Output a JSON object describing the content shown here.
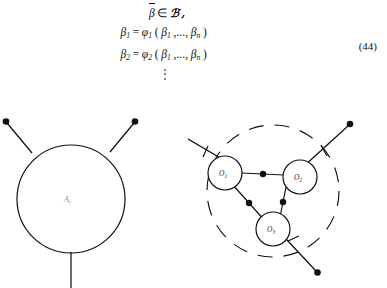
{
  "equation": {
    "number": "(44)",
    "lines": [
      {
        "id": "line-membership",
        "lhs": "β",
        "lhs_bar": true,
        "rel": "∈",
        "rhs": "ℬ′,",
        "text": "β̄ ∈ ℬ′,"
      },
      {
        "id": "line-beta-1",
        "lhs": "β",
        "lhs_sub": "1",
        "rel": "=",
        "fn": "φ",
        "fn_sub": "1",
        "args": "(β1 ,..., βn)",
        "text": "β1 = φ1(β1 ,..., βn)"
      },
      {
        "id": "line-beta-2",
        "lhs": "β",
        "lhs_sub": "2",
        "rel": "=",
        "fn": "φ",
        "fn_sub": "2",
        "args": "(β1 ,..., βn)",
        "text": "β2 = φ2(β1 ,..., βn)"
      },
      {
        "id": "line-vdots",
        "text": "⋮"
      }
    ],
    "arg_first": "β",
    "arg_first_sub": "1",
    "arg_ellipsis": ",...,",
    "arg_last": "β",
    "arg_last_sub": "n",
    "paren_open": "(",
    "paren_close": ")"
  },
  "figures": {
    "left": {
      "name": "blob-vertex-diagram",
      "vertex_label": "A",
      "vertex_label_sub": "i",
      "legs": [
        {
          "id": "leg-upper-left",
          "terminal": "filled-dot"
        },
        {
          "id": "leg-upper-right",
          "terminal": "filled-dot"
        },
        {
          "id": "leg-bottom",
          "terminal": "open"
        }
      ]
    },
    "right": {
      "name": "expanded-triangle-diagram",
      "nodes": [
        {
          "id": "node-o1",
          "label": "O",
          "label_sub": "1"
        },
        {
          "id": "node-o2",
          "label": "O",
          "label_sub": "2"
        },
        {
          "id": "node-o3",
          "label": "O",
          "label_sub": "3"
        }
      ],
      "internal_edges": [
        {
          "id": "edge-o1-o2",
          "marker": "filled-dot"
        },
        {
          "id": "edge-o2-o3",
          "marker": "filled-dot"
        },
        {
          "id": "edge-o1-o3",
          "marker": "filled-dot"
        }
      ],
      "external_legs": [
        {
          "id": "leg-o1-external",
          "tick": true,
          "terminal": "filled-dot"
        },
        {
          "id": "leg-o2-external",
          "tick": true,
          "terminal": "filled-dot"
        },
        {
          "id": "leg-o3-external",
          "tick": true,
          "terminal": "filled-dot"
        }
      ],
      "enclosure": {
        "id": "dashed-boundary-circle",
        "style": "dashed"
      }
    }
  },
  "colors": {
    "ink": "#1a1a1a",
    "stroke": "#111111",
    "label_gray": "#8c8c8c",
    "background": "#ffffff"
  }
}
